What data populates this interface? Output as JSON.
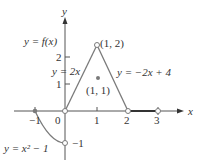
{
  "figure": {
    "function_label": "y = f(x)",
    "axes": {
      "x_label": "x",
      "y_label": "y",
      "x_ticks": [
        "−1",
        "0",
        "1",
        "2",
        "3"
      ],
      "y_ticks": [
        "1",
        "2"
      ],
      "y_neg_label": "−1"
    },
    "pieces": [
      {
        "name": "parabola",
        "label": "y = x² − 1",
        "domain": "[-1, 0)"
      },
      {
        "name": "line-up",
        "label": "y = 2x",
        "domain": "(0, 1)"
      },
      {
        "name": "line-down",
        "label": "y = −2x + 4",
        "domain": "(1, 2)"
      },
      {
        "name": "zero-segment",
        "label": "",
        "domain": "(2, 3)"
      }
    ],
    "points": {
      "peak": "(1, 2)",
      "isolated": "(1, 1)"
    },
    "colors": {
      "curve": "#7a7a7a",
      "axis": "#555555",
      "text": "#333333"
    }
  }
}
